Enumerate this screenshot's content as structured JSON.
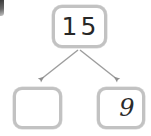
{
  "diagram": {
    "type": "number-bond",
    "whole": {
      "label": "15",
      "filled": true
    },
    "parts": [
      {
        "label": "",
        "filled": false,
        "position": "left"
      },
      {
        "label": "9",
        "filled": true,
        "position": "right"
      }
    ],
    "connectors": [
      {
        "from": "whole",
        "to": "part-left",
        "style": "arrow"
      },
      {
        "from": "whole",
        "to": "part-right",
        "style": "arrow"
      }
    ],
    "colors": {
      "background": "#ffffff",
      "box_border": "#bdbdbd",
      "arrow": "#9a9a9a",
      "text": "#272727"
    }
  }
}
